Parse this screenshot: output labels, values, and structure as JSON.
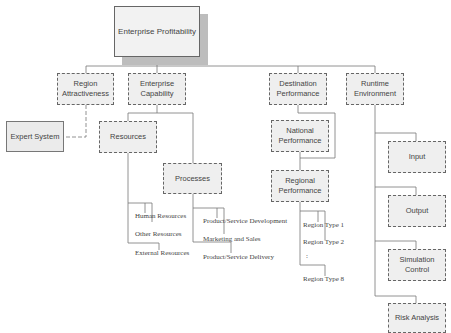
{
  "root": {
    "label": "Enterprise Profitability"
  },
  "level1": {
    "region_attractiveness": "Region Attractiveness",
    "enterprise_capability": "Enterprise Capability",
    "destination_performance": "Destination Performance",
    "runtime_environment": "Runtime Environment"
  },
  "expert_system": "Expert System",
  "enterprise_capability_children": {
    "resources": "Resources",
    "processes": "Processes"
  },
  "resources_items": [
    "Human Resources",
    "Other Resources",
    "External Resources"
  ],
  "processes_items": [
    "Product/Service Development",
    "Marketing and Sales",
    "Product/Service Delivery"
  ],
  "destination_children": {
    "national": "National Performance",
    "regional": "Regional Performance"
  },
  "region_types": [
    "Region Type 1",
    "Region Type 2",
    "Region Type 8"
  ],
  "region_ellipsis": ":",
  "runtime_children": [
    "Input",
    "Output",
    "Simulation Control",
    "Risk Analysis"
  ]
}
